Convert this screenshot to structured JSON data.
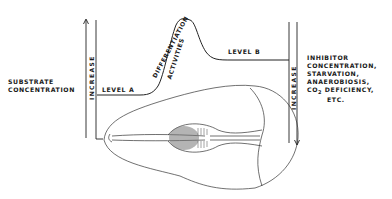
{
  "diagram": {
    "left_label": [
      "SUBSTRATE",
      "CONCENTRATION"
    ],
    "left_axis_label": "INCREASE",
    "right_axis_label": "INCREASE",
    "right_label": [
      "INHIBITOR",
      "CONCENTRATION,",
      "STARVATION,",
      "ANAEROBIOSIS,",
      "CO",
      "2",
      " DEFICIENCY,",
      "ETC."
    ],
    "level_a": "LEVEL  A",
    "level_b": "LEVEL  B",
    "peak_label_1": "DIFFERENTIATION",
    "peak_label_2": "ACTIVITIES",
    "colors": {
      "ink": "#1a1a1a",
      "background": "#ffffff"
    }
  }
}
